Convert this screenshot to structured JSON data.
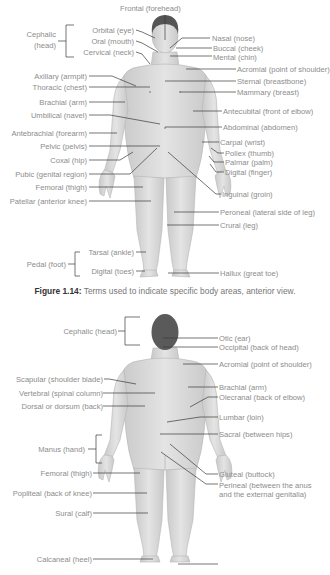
{
  "anterior": {
    "top": "Frontal (forehead)",
    "left": [
      {
        "id": "cephalic",
        "text": "Cephalic",
        "text2": "(head)"
      },
      {
        "id": "orbital",
        "text": "Orbital (eye)"
      },
      {
        "id": "oral",
        "text": "Oral (mouth)"
      },
      {
        "id": "cervical",
        "text": "Cervical (neck)"
      },
      {
        "id": "axillary",
        "text": "Axillary (armpit)"
      },
      {
        "id": "thoracic",
        "text": "Thoracic (chest)"
      },
      {
        "id": "brachial",
        "text": "Brachial (arm)"
      },
      {
        "id": "umbilical",
        "text": "Umbilical (navel)"
      },
      {
        "id": "antebrachial",
        "text": "Antebrachial (forearm)"
      },
      {
        "id": "pelvic",
        "text": "Pelvic (pelvis)"
      },
      {
        "id": "coxal",
        "text": "Coxal (hip)"
      },
      {
        "id": "pubic",
        "text": "Pubic (genital region)"
      },
      {
        "id": "femoral",
        "text": "Femoral (thigh)"
      },
      {
        "id": "patellar",
        "text": "Patellar (anterior knee)"
      },
      {
        "id": "pedal",
        "text": "Pedal (foot)"
      },
      {
        "id": "tarsal",
        "text": "Tarsal (ankle)"
      },
      {
        "id": "digital_toes",
        "text": "Digital (toes)"
      }
    ],
    "right": [
      {
        "id": "nasal",
        "text": "Nasal (nose)"
      },
      {
        "id": "buccal",
        "text": "Buccal (cheek)"
      },
      {
        "id": "mental",
        "text": "Mental (chin)"
      },
      {
        "id": "acromial",
        "text": "Acromial (point of shoulder)"
      },
      {
        "id": "sternal",
        "text": "Sternal (breastbone)"
      },
      {
        "id": "mammary",
        "text": "Mammary (breast)"
      },
      {
        "id": "antecubital",
        "text": "Antecubital (front of elbow)"
      },
      {
        "id": "abdominal",
        "text": "Abdominal (abdomen)"
      },
      {
        "id": "carpal",
        "text": "Carpal (wrist)"
      },
      {
        "id": "pollex",
        "text": "Pollex (thumb)"
      },
      {
        "id": "palmar",
        "text": "Palmar (palm)"
      },
      {
        "id": "digital_finger",
        "text": "Digital (finger)"
      },
      {
        "id": "inguinal",
        "text": "Inguinal (groin)"
      },
      {
        "id": "peroneal",
        "text": "Peroneal (lateral side of leg)"
      },
      {
        "id": "crural",
        "text": "Crural (leg)"
      },
      {
        "id": "hallux",
        "text": "Hallux (great toe)"
      }
    ]
  },
  "caption": {
    "label": "Figure 1.14:",
    "text": " Terms used to indicate specific body areas, anterior view."
  },
  "posterior": {
    "left": [
      {
        "id": "cephalic",
        "text": "Cephalic (head)"
      },
      {
        "id": "scapular",
        "text": "Scapular (shoulder blade)"
      },
      {
        "id": "vertebral",
        "text": "Vertebral (spinal column)"
      },
      {
        "id": "dorsal",
        "text": "Dorsal or dorsum (back)"
      },
      {
        "id": "manus",
        "text": "Manus (hand)"
      },
      {
        "id": "femoral",
        "text": "Femoral (thigh)"
      },
      {
        "id": "popliteal",
        "text": "Popliteal (back of knee)"
      },
      {
        "id": "sural",
        "text": "Sural (calf)"
      },
      {
        "id": "calcaneal",
        "text": "Calcaneal (heel)"
      }
    ],
    "right": [
      {
        "id": "otic",
        "text": "Otic (ear)"
      },
      {
        "id": "occipital",
        "text": "Occipital (back of head)"
      },
      {
        "id": "acromial",
        "text": "Acromial (point of shoulder)"
      },
      {
        "id": "brachial",
        "text": "Brachial (arm)"
      },
      {
        "id": "olecranal",
        "text": "Olecranal (back of elbow)"
      },
      {
        "id": "lumbar",
        "text": "Lumbar (loin)"
      },
      {
        "id": "sacral",
        "text": "Sacral (between hips)"
      },
      {
        "id": "gluteal",
        "text": "Gluteal (buttock)"
      },
      {
        "id": "perineal",
        "text": "Perineal (between the anus",
        "text2": "and the external genitalia)"
      }
    ]
  },
  "colors": {
    "skin": "#dcdcdc",
    "skin_shade": "#c4c4c4",
    "hair": "#555555",
    "leader": "#3a3a3a",
    "label": "#8c8c8c"
  }
}
